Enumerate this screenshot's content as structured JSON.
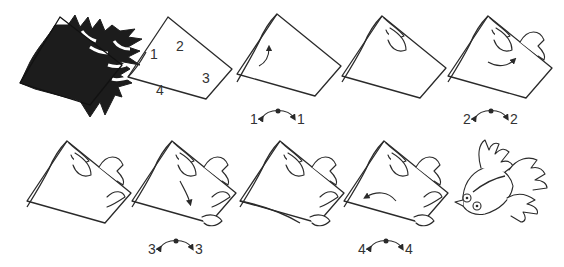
{
  "diagram": {
    "type": "paper-folding-instructions",
    "colors": {
      "line": "#2a2a2a",
      "shape_fill": "#1c1c1c",
      "background": "#ffffff"
    },
    "steps": [
      {
        "index": 1,
        "description": "template-black-fish-shape"
      },
      {
        "index": 2,
        "description": "square-with-numbered-edges",
        "edge_labels": [
          "1",
          "2",
          "3",
          "4"
        ]
      },
      {
        "index": 3,
        "description": "fold-edge-1",
        "swap_label_left": "1",
        "swap_label_right": "1"
      },
      {
        "index": 4,
        "description": "edge-1-folded-fins"
      },
      {
        "index": 5,
        "description": "fold-edge-2",
        "swap_label_left": "2",
        "swap_label_right": "2"
      },
      {
        "index": 6,
        "description": "edge-2-folded-fins"
      },
      {
        "index": 7,
        "description": "fold-edge-3",
        "swap_label_left": "3",
        "swap_label_right": "3"
      },
      {
        "index": 8,
        "description": "edge-3-folded-fins"
      },
      {
        "index": 9,
        "description": "fold-edge-4",
        "swap_label_left": "4",
        "swap_label_right": "4"
      },
      {
        "index": 10,
        "description": "finished-fish"
      }
    ]
  }
}
